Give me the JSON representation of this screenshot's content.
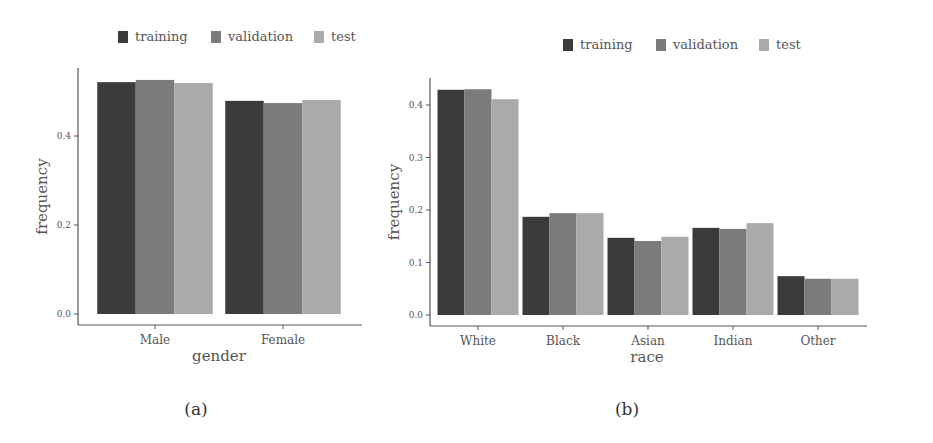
{
  "colors": {
    "training": "#3b3b3b",
    "validation": "#7b7b7b",
    "test": "#aaaaaa",
    "axis": "#555555",
    "text": "#555555"
  },
  "chart_data": [
    {
      "type": "bar",
      "panel_label": "(a)",
      "title": "",
      "xlabel": "gender",
      "ylabel": "frequency",
      "categories": [
        "Male",
        "Female"
      ],
      "series": [
        {
          "name": "training",
          "values": [
            0.521,
            0.479
          ]
        },
        {
          "name": "validation",
          "values": [
            0.526,
            0.474
          ]
        },
        {
          "name": "test",
          "values": [
            0.519,
            0.481
          ]
        }
      ],
      "yticks": [
        "0.0",
        "0.2",
        "0.4"
      ],
      "ytick_values": [
        0.0,
        0.2,
        0.4
      ],
      "ylim": [
        0,
        0.55
      ],
      "legend": [
        "training",
        "validation",
        "test"
      ],
      "legend_position": "top",
      "grid": false
    },
    {
      "type": "bar",
      "panel_label": "(b)",
      "title": "",
      "xlabel": "race",
      "ylabel": "frequency",
      "categories": [
        "White",
        "Black",
        "Asian",
        "Indian",
        "Other"
      ],
      "series": [
        {
          "name": "training",
          "values": [
            0.429,
            0.187,
            0.147,
            0.166,
            0.074
          ]
        },
        {
          "name": "validation",
          "values": [
            0.43,
            0.194,
            0.141,
            0.164,
            0.069
          ]
        },
        {
          "name": "test",
          "values": [
            0.411,
            0.194,
            0.149,
            0.175,
            0.069
          ]
        }
      ],
      "yticks": [
        "0.0",
        "0.1",
        "0.2",
        "0.3",
        "0.4"
      ],
      "ytick_values": [
        0.0,
        0.1,
        0.2,
        0.3,
        0.4
      ],
      "ylim": [
        0,
        0.45
      ],
      "legend": [
        "training",
        "validation",
        "test"
      ],
      "legend_position": "top",
      "grid": false
    }
  ]
}
